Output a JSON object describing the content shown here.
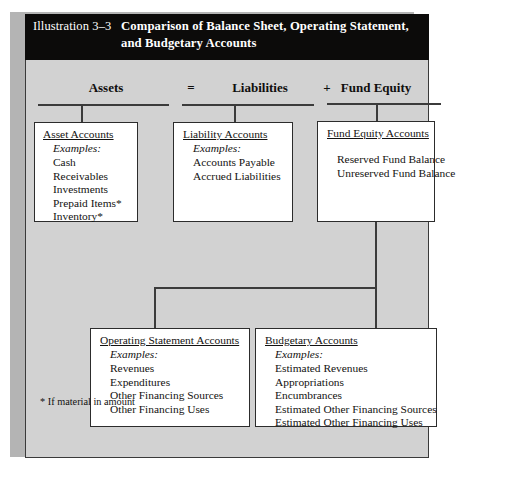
{
  "figure": {
    "label": "Illustration 3–3",
    "title": "Comparison of Balance Sheet, Operating Statement, and Budgetary Accounts",
    "title_line1": "Comparison of Balance Sheet, Operating Statement,",
    "title_line2": "and Budgetary Accounts",
    "footnote": "* If material in amount",
    "colors": {
      "title_bar": "#0c0b0a",
      "title_text": "#ffffff",
      "panel_background": "#d2d2d2",
      "box_background": "#ffffff",
      "line": "#3b3b3b",
      "text": "#131211",
      "shadow": "#b4b4b4"
    }
  },
  "equation": {
    "headings": [
      {
        "label": "Assets"
      },
      {
        "label": "Liabilities"
      },
      {
        "label": "Fund Equity"
      }
    ],
    "operators": [
      {
        "symbol": "="
      },
      {
        "symbol": "+"
      }
    ]
  },
  "boxes": {
    "assets": {
      "title": "Asset Accounts",
      "examples_label": "Examples:",
      "items": [
        "Cash",
        "Receivables",
        "Investments",
        "Prepaid Items*",
        "Inventory*"
      ]
    },
    "liabilities": {
      "title": "Liability Accounts",
      "examples_label": "Examples:",
      "items": [
        "Accounts Payable",
        "Accrued Liabilities"
      ]
    },
    "fund_equity": {
      "title": "Fund Equity Accounts",
      "examples_label": "",
      "items": [
        "Reserved Fund Balance",
        "Unreserved Fund Balance"
      ]
    },
    "operating_statement": {
      "title": "Operating Statement Accounts",
      "examples_label": "Examples:",
      "items": [
        "Revenues",
        "Expenditures",
        "Other Financing Sources",
        "Other Financing Uses"
      ]
    },
    "budgetary": {
      "title": "Budgetary Accounts",
      "examples_label": "Examples:",
      "items": [
        "Estimated Revenues",
        "Appropriations",
        "Encumbrances",
        "Estimated Other Financing Sources",
        "Estimated Other Financing Uses"
      ]
    }
  }
}
